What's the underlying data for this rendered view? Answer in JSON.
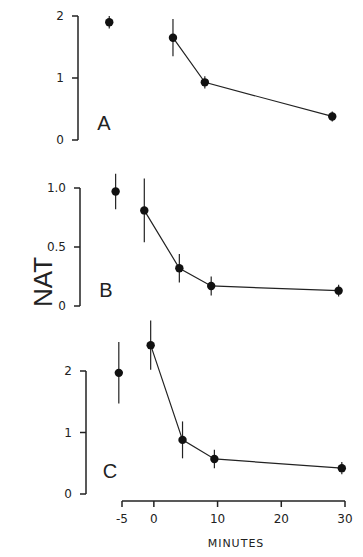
{
  "chart_data": {
    "type": "line",
    "ylabel": "NAT",
    "xlabel": "MINUTES",
    "x_ticks": [
      -5,
      0,
      10,
      20,
      30
    ],
    "xlim": [
      -5,
      30
    ],
    "panels": [
      {
        "label": "A",
        "ylim": [
          0,
          2
        ],
        "y_ticks": [
          "0",
          "1",
          "2"
        ],
        "pre_point": {
          "x": -7,
          "y": 1.9,
          "err": 0.1
        },
        "series": [
          {
            "x": 3,
            "y": 1.65,
            "err": 0.3
          },
          {
            "x": 8,
            "y": 0.93,
            "err": 0.1
          },
          {
            "x": 28,
            "y": 0.38,
            "err": 0.08
          }
        ]
      },
      {
        "label": "B",
        "ylim": [
          0,
          1.0
        ],
        "y_ticks": [
          "0",
          "0.5",
          "1.0"
        ],
        "pre_point": {
          "x": -6,
          "y": 0.97,
          "err": 0.15
        },
        "series": [
          {
            "x": -1.5,
            "y": 0.81,
            "err": 0.27
          },
          {
            "x": 4,
            "y": 0.32,
            "err": 0.12
          },
          {
            "x": 9,
            "y": 0.17,
            "err": 0.08
          },
          {
            "x": 29,
            "y": 0.13,
            "err": 0.05
          }
        ]
      },
      {
        "label": "C",
        "ylim": [
          0,
          2
        ],
        "y_ticks": [
          "0",
          "1",
          "2"
        ],
        "pre_point": {
          "x": -5.5,
          "y": 1.97,
          "err": 0.5
        },
        "series": [
          {
            "x": -0.5,
            "y": 2.42,
            "err": 0.4
          },
          {
            "x": 4.5,
            "y": 0.88,
            "err": 0.3
          },
          {
            "x": 9.5,
            "y": 0.57,
            "err": 0.15
          },
          {
            "x": 29.5,
            "y": 0.42,
            "err": 0.1
          }
        ]
      }
    ]
  }
}
